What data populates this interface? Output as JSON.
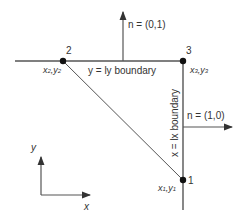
{
  "diagram": {
    "points": [
      {
        "id": "1",
        "label": "1",
        "coord_label": "x1,y1"
      },
      {
        "id": "2",
        "label": "2",
        "coord_label": "x2,y2"
      },
      {
        "id": "3",
        "label": "3",
        "coord_label": "x3,y3"
      }
    ],
    "boundaries": {
      "top": "y = ly boundary",
      "right": "x = lx boundary"
    },
    "normals": {
      "top": "n = (0,1)",
      "right": "n = (1,0)"
    },
    "axes": {
      "x": "x",
      "y": "y"
    },
    "colors": {
      "line": "#555555",
      "point": "#111111",
      "text": "#333333"
    }
  }
}
